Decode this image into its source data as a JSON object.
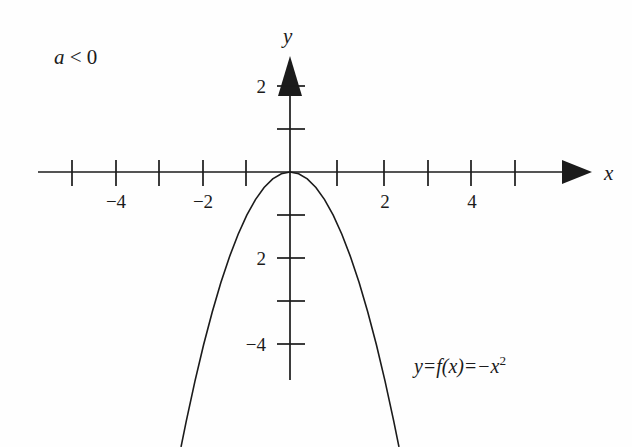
{
  "figure": {
    "background_color": "#fefefe",
    "ink_color": "#1b1b1b",
    "condition_label_a": "a",
    "condition_label_rel": " < 0",
    "equation_y": "y",
    "equation_eq1": "=",
    "equation_f": "f",
    "equation_arg": "(x)",
    "equation_eq2": "=",
    "equation_neg": "−",
    "equation_var": "x",
    "equation_exp": "2",
    "x_axis_name": "x",
    "y_axis_name": "y"
  },
  "chart_data": {
    "type": "line",
    "title": "",
    "subtitle": "",
    "xlabel": "x",
    "ylabel": "y",
    "xlim": [
      -5.8,
      7.0
    ],
    "ylim": [
      -6.4,
      2.75
    ],
    "grid": false,
    "legend_position": "none",
    "annotations": [
      {
        "name": "condition",
        "text": "a < 0",
        "x": -4.5,
        "y": 2.35
      },
      {
        "name": "equation",
        "text": "y = f(x) = -x²",
        "x": 3.0,
        "y": -4.3
      }
    ],
    "x_ticks": [
      -5,
      -4,
      -3,
      -2,
      -1,
      1,
      2,
      3,
      4,
      5
    ],
    "x_tick_labels": [
      "",
      "−4",
      "",
      "−2",
      "",
      "",
      "2",
      "",
      "4",
      ""
    ],
    "y_ticks": [
      2,
      1,
      -1,
      -2,
      -3,
      -4
    ],
    "y_tick_labels": [
      "2",
      "",
      "",
      "2",
      "",
      "−4"
    ],
    "series": [
      {
        "name": "y = -x^2",
        "color": "#1b1b1b",
        "x": [
          -2.52,
          -2.4,
          -2.2,
          -2.0,
          -1.8,
          -1.6,
          -1.4,
          -1.2,
          -1.0,
          -0.8,
          -0.6,
          -0.4,
          -0.2,
          0.0,
          0.2,
          0.4,
          0.6,
          0.8,
          1.0,
          1.2,
          1.4,
          1.6,
          1.8,
          2.0,
          2.2,
          2.4,
          2.52
        ],
        "y": [
          -6.35,
          -5.76,
          -4.84,
          -4.0,
          -3.24,
          -2.56,
          -1.96,
          -1.44,
          -1.0,
          -0.64,
          -0.36,
          -0.16,
          -0.04,
          0.0,
          -0.04,
          -0.16,
          -0.36,
          -0.64,
          -1.0,
          -1.44,
          -1.96,
          -2.56,
          -3.24,
          -4.0,
          -4.84,
          -5.76,
          -6.35
        ]
      }
    ]
  }
}
